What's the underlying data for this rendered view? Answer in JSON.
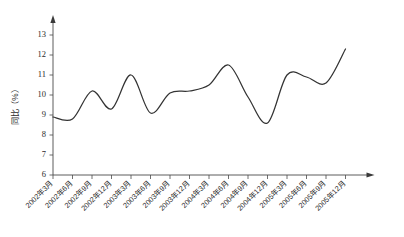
{
  "chart_data": {
    "type": "line",
    "title": "",
    "subtitle": "",
    "xlabel": "",
    "ylabel": "同比（%）",
    "ylim": [
      6,
      13
    ],
    "ytick_step": 1,
    "yticks": [
      6,
      7,
      8,
      9,
      10,
      11,
      12,
      13
    ],
    "grid": false,
    "legend": null,
    "legend_position": "none",
    "axis_arrows": {
      "y_axis": "up-arrow",
      "x_axis": "right-arrow"
    },
    "categories": [
      "2002年3月",
      "2002年6月",
      "2002年9月",
      "2002年12月",
      "2003年3月",
      "2003年6月",
      "2003年9月",
      "2003年12月",
      "2004年3月",
      "2004年6月",
      "2004年9月",
      "2004年12月",
      "2005年3月",
      "2005年6月",
      "2005年9月",
      "2005年12月"
    ],
    "values": [
      8.9,
      8.8,
      10.2,
      9.3,
      11.0,
      9.1,
      10.1,
      10.2,
      10.5,
      11.5,
      9.9,
      8.6,
      11.0,
      10.9,
      10.6,
      12.3
    ],
    "series": [
      {
        "name": "同比",
        "color": "#333333",
        "values": [
          8.9,
          8.8,
          10.2,
          9.3,
          11.0,
          9.1,
          10.1,
          10.2,
          10.5,
          11.5,
          9.9,
          8.6,
          11.0,
          10.9,
          10.6,
          12.3
        ]
      }
    ],
    "annotations": []
  },
  "style": {
    "line_color": "#333333",
    "axis_color": "#4a4a4a",
    "text_color": "#2b2b2b",
    "background": "#ffffff"
  }
}
